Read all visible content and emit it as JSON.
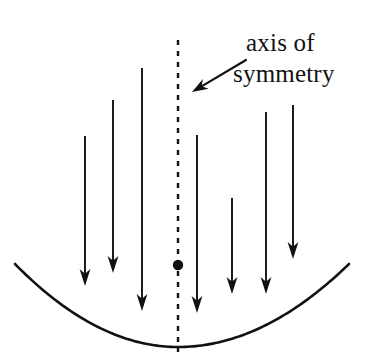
{
  "figure": {
    "background_color": "#ffffff",
    "stroke_color": "#111111",
    "width": 372,
    "height": 357
  },
  "annotation": {
    "line1": "axis of",
    "line2": "symmetry",
    "pointer_icon": "arrow-left-down-icon",
    "pointer": {
      "x1": 246,
      "y1": 60,
      "x2": 192,
      "y2": 92
    }
  },
  "axis_of_symmetry": {
    "icon": "dashed-vertical-line-icon",
    "x": 178,
    "y_top": 40,
    "y_bottom": 352,
    "dash_pattern": "5 6",
    "stroke_width": 2.4
  },
  "focus_point": {
    "icon": "filled-dot-icon",
    "x": 178,
    "y": 265,
    "radius": 5.2
  },
  "parabola": {
    "icon": "parabola-curve-icon",
    "vertex": {
      "x": 178,
      "y": 347
    },
    "left_end": {
      "x": 15,
      "y": 264
    },
    "right_end": {
      "x": 349,
      "y": 264
    },
    "stroke_width": 2.6
  },
  "arrows": {
    "icon": "down-arrow-icon",
    "stroke_width": 1.9,
    "head_length": 17,
    "head_half_width": 5.4,
    "items": [
      {
        "name": "arrow-left-1",
        "x": 85,
        "y_start": 136,
        "y_end": 286
      },
      {
        "name": "arrow-left-2",
        "x": 113,
        "y_start": 100,
        "y_end": 273
      },
      {
        "name": "arrow-left-3",
        "x": 142,
        "y_start": 68,
        "y_end": 311
      },
      {
        "name": "arrow-right-1",
        "x": 197,
        "y_start": 135,
        "y_end": 313
      },
      {
        "name": "arrow-right-2",
        "x": 232,
        "y_start": 198,
        "y_end": 294
      },
      {
        "name": "arrow-right-3",
        "x": 266,
        "y_start": 112,
        "y_end": 294
      },
      {
        "name": "arrow-right-4",
        "x": 293,
        "y_start": 105,
        "y_end": 259
      }
    ]
  }
}
